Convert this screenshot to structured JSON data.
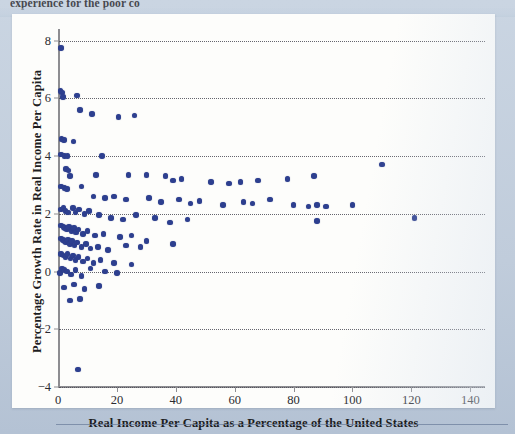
{
  "page": {
    "cutoff_text_above": "experience for the poor co",
    "background_color": "#c3cfdd",
    "card_color": "#fdfdfb"
  },
  "chart_data": {
    "type": "scatter",
    "title": "",
    "xlabel": "Real Income Per Capita as a Percentage of the United States",
    "ylabel": "Percentage Growth Rate in Real Income Per Capita",
    "xlim": [
      0,
      145
    ],
    "ylim": [
      -4,
      8.4
    ],
    "xticks": [
      0,
      20,
      40,
      60,
      80,
      100,
      120,
      140
    ],
    "yticks": [
      8,
      6,
      4,
      2,
      0,
      -2,
      -4
    ],
    "xtick_labels": [
      "0",
      "20",
      "40",
      "60",
      "80",
      "100",
      "120",
      "140"
    ],
    "ytick_labels": [
      "8",
      "6",
      "4",
      "2",
      "0",
      "−2",
      "−4"
    ],
    "grid": "horizontal-dotted",
    "legend": "none",
    "marker_color": "#2d3f8f",
    "marker_shape": "circle",
    "series": [
      {
        "name": "Countries",
        "points": [
          [
            1.0,
            7.75
          ],
          [
            0.8,
            6.25
          ],
          [
            1.3,
            6.2
          ],
          [
            1.6,
            6.05
          ],
          [
            6.5,
            6.1
          ],
          [
            7.4,
            5.6
          ],
          [
            11.5,
            5.45
          ],
          [
            20.5,
            5.35
          ],
          [
            26.0,
            5.4
          ],
          [
            1.2,
            4.6
          ],
          [
            2.0,
            4.55
          ],
          [
            5.2,
            4.5
          ],
          [
            1.0,
            4.05
          ],
          [
            2.2,
            4.0
          ],
          [
            3.2,
            4.0
          ],
          [
            15.0,
            4.0
          ],
          [
            2.8,
            3.55
          ],
          [
            3.5,
            3.5
          ],
          [
            4.0,
            3.3
          ],
          [
            13.0,
            3.35
          ],
          [
            24.0,
            3.35
          ],
          [
            30.0,
            3.35
          ],
          [
            36.5,
            3.3
          ],
          [
            39.0,
            3.15
          ],
          [
            42.0,
            3.2
          ],
          [
            52.0,
            3.1
          ],
          [
            58.0,
            3.05
          ],
          [
            62.0,
            3.1
          ],
          [
            68.0,
            3.15
          ],
          [
            78.0,
            3.2
          ],
          [
            87.0,
            3.3
          ],
          [
            110.0,
            3.7
          ],
          [
            1.0,
            2.95
          ],
          [
            2.2,
            2.9
          ],
          [
            3.0,
            2.85
          ],
          [
            8.0,
            2.95
          ],
          [
            12.0,
            2.6
          ],
          [
            16.0,
            2.55
          ],
          [
            19.0,
            2.6
          ],
          [
            23.0,
            2.5
          ],
          [
            31.0,
            2.55
          ],
          [
            35.0,
            2.4
          ],
          [
            41.0,
            2.5
          ],
          [
            45.0,
            2.35
          ],
          [
            48.0,
            2.45
          ],
          [
            56.0,
            2.3
          ],
          [
            63.0,
            2.4
          ],
          [
            66.0,
            2.35
          ],
          [
            72.0,
            2.5
          ],
          [
            80.0,
            2.3
          ],
          [
            85.0,
            2.25
          ],
          [
            88.0,
            2.3
          ],
          [
            91.0,
            2.25
          ],
          [
            100.0,
            2.3
          ],
          [
            121.0,
            1.85
          ],
          [
            88.0,
            1.75
          ],
          [
            1.0,
            2.15
          ],
          [
            1.8,
            2.2
          ],
          [
            2.6,
            2.1
          ],
          [
            3.4,
            2.05
          ],
          [
            5.0,
            2.2
          ],
          [
            6.0,
            2.05
          ],
          [
            7.2,
            2.15
          ],
          [
            9.0,
            2.0
          ],
          [
            10.5,
            2.1
          ],
          [
            14.0,
            1.95
          ],
          [
            18.0,
            1.85
          ],
          [
            22.0,
            1.8
          ],
          [
            26.5,
            1.95
          ],
          [
            33.0,
            1.85
          ],
          [
            38.0,
            1.7
          ],
          [
            44.0,
            1.8
          ],
          [
            1.0,
            1.6
          ],
          [
            1.8,
            1.55
          ],
          [
            2.4,
            1.5
          ],
          [
            3.0,
            1.45
          ],
          [
            3.8,
            1.55
          ],
          [
            4.6,
            1.4
          ],
          [
            5.4,
            1.5
          ],
          [
            6.2,
            1.35
          ],
          [
            7.0,
            1.45
          ],
          [
            8.5,
            1.3
          ],
          [
            10.0,
            1.4
          ],
          [
            12.5,
            1.25
          ],
          [
            15.5,
            1.3
          ],
          [
            21.0,
            1.2
          ],
          [
            25.0,
            1.25
          ],
          [
            30.0,
            1.05
          ],
          [
            1.0,
            1.15
          ],
          [
            1.6,
            1.1
          ],
          [
            2.2,
            1.05
          ],
          [
            2.8,
            1.0
          ],
          [
            3.4,
            1.1
          ],
          [
            4.0,
            0.95
          ],
          [
            4.8,
            1.05
          ],
          [
            5.6,
            0.9
          ],
          [
            6.4,
            1.0
          ],
          [
            8.0,
            0.85
          ],
          [
            9.5,
            0.95
          ],
          [
            11.0,
            0.8
          ],
          [
            13.5,
            0.85
          ],
          [
            17.0,
            0.75
          ],
          [
            23.0,
            0.9
          ],
          [
            28.0,
            0.85
          ],
          [
            39.0,
            0.95
          ],
          [
            1.0,
            0.6
          ],
          [
            1.8,
            0.55
          ],
          [
            2.6,
            0.5
          ],
          [
            3.2,
            0.6
          ],
          [
            4.2,
            0.45
          ],
          [
            5.0,
            0.55
          ],
          [
            6.0,
            0.4
          ],
          [
            7.0,
            0.5
          ],
          [
            8.5,
            0.35
          ],
          [
            10.0,
            0.45
          ],
          [
            12.0,
            0.3
          ],
          [
            14.5,
            0.4
          ],
          [
            19.0,
            0.3
          ],
          [
            25.0,
            0.25
          ],
          [
            0.6,
            -0.05
          ],
          [
            1.4,
            0.1
          ],
          [
            2.2,
            0.05
          ],
          [
            3.0,
            0.0
          ],
          [
            4.5,
            -0.1
          ],
          [
            6.0,
            0.05
          ],
          [
            8.0,
            -0.15
          ],
          [
            11.0,
            0.1
          ],
          [
            16.0,
            0.0
          ],
          [
            20.0,
            -0.05
          ],
          [
            2.0,
            -0.55
          ],
          [
            5.5,
            -0.45
          ],
          [
            9.0,
            -0.6
          ],
          [
            14.0,
            -0.5
          ],
          [
            4.0,
            -1.0
          ],
          [
            7.5,
            -0.95
          ],
          [
            6.8,
            -3.4
          ]
        ]
      }
    ],
    "n_points": 134
  }
}
